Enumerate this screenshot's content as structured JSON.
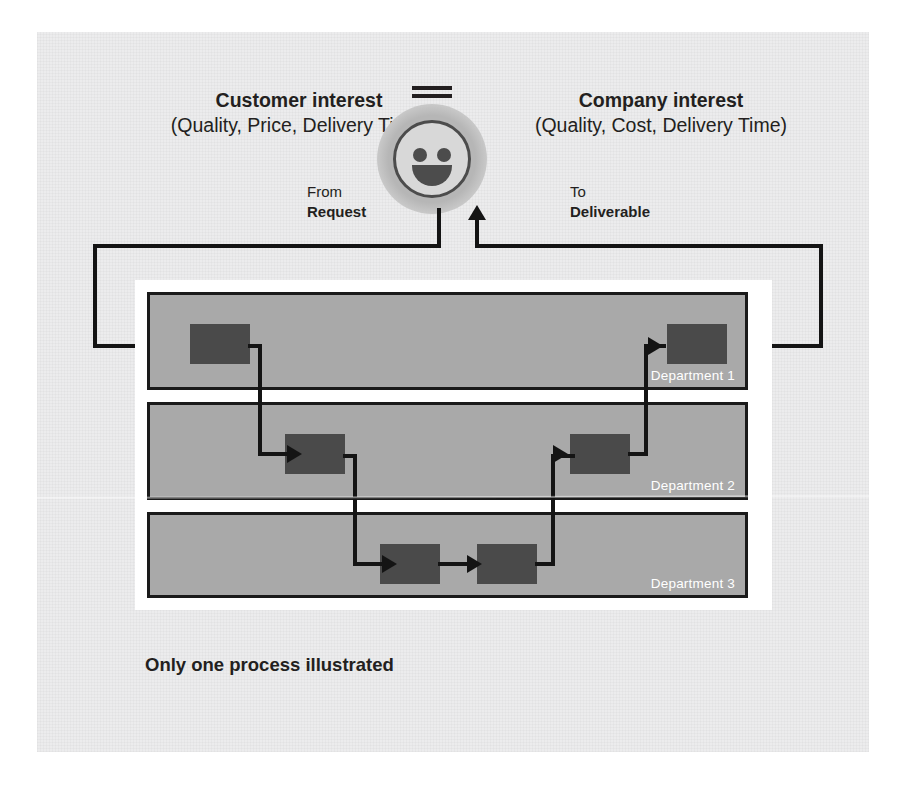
{
  "diagram": {
    "caption": "Only one process illustrated",
    "colors": {
      "page_background": "#ffffff",
      "canvas_background": "#ececed",
      "department_fill": "#a9a9a9",
      "department_border": "#1a1a1a",
      "node_fill": "#4a4a4a",
      "connector": "#141414",
      "frame": "#ffffff",
      "text": "#231f20",
      "department_label_text": "#ffffff",
      "smiley_face": "#d8d8d8",
      "smiley_outline": "#4c4c4c",
      "smiley_glow": "#b6b6b6"
    },
    "headings": {
      "customer": {
        "title": "Customer interest",
        "subtitle": "(Quality, Price, Delivery Time)"
      },
      "company": {
        "title": "Company interest",
        "subtitle": "(Quality, Cost, Delivery Time)"
      }
    },
    "endpoints": {
      "from": {
        "label": "From",
        "value": "Request"
      },
      "to": {
        "label": "To",
        "value": "Deliverable"
      }
    },
    "equality": {
      "symbol": "=",
      "meaning": "equals"
    },
    "smiley": {
      "icon": "smiley-face-icon",
      "expression": "happy"
    },
    "departments": [
      {
        "label": "Department 1",
        "nodes": 2
      },
      {
        "label": "Department 2",
        "nodes": 2
      },
      {
        "label": "Department 3",
        "nodes": 2
      }
    ],
    "flow_sequence": [
      "Request",
      "Department 1 - step 1",
      "Department 2 - step 1",
      "Department 3 - step 1",
      "Department 3 - step 2",
      "Department 2 - step 2",
      "Department 1 - step 2",
      "Deliverable"
    ]
  }
}
